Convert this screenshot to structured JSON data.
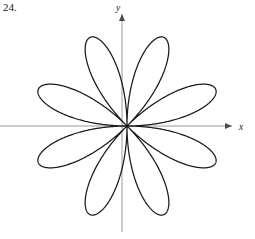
{
  "figure": {
    "problem_number": "24.",
    "width": 255,
    "height": 239,
    "background_color": "#ffffff"
  },
  "axes": {
    "x_label": "x",
    "y_label": "y",
    "axis_color": "#9a9a9a",
    "arrow_color": "#4a4a4a",
    "origin_x": 127,
    "origin_y": 126,
    "x_axis_y": 126,
    "y_axis_x": 122,
    "x_axis_start": 0,
    "x_axis_end": 232,
    "y_axis_start": 232,
    "y_axis_end": 14
  },
  "curve": {
    "color": "#1a1a1a",
    "stroke_width": 1.25,
    "petal_count": 8,
    "max_radius": 96,
    "angle_offset_deg": 22.5,
    "petal_angles_deg": [
      22.5,
      67.5,
      112.5,
      157.5,
      202.5,
      247.5,
      292.5,
      337.5
    ]
  },
  "chart_data": {
    "type": "line",
    "title": "",
    "subtitle": "",
    "xlabel": "x",
    "ylabel": "y",
    "grid": false,
    "legend": "none",
    "coordinate_system": "polar",
    "equation": "r = a cos(4θ)",
    "petal_count": 8,
    "amplitude": 96,
    "frequency_k": 4,
    "angle_offset_deg": 22.5,
    "xlim": [
      -127,
      128
    ],
    "ylim": [
      -113,
      126
    ],
    "annotations": [
      "24."
    ],
    "tick_labels": [],
    "petals": [
      {
        "index": 1,
        "tip_angle_deg": 22.5,
        "tip_radius": 96
      },
      {
        "index": 2,
        "tip_angle_deg": 67.5,
        "tip_radius": 96
      },
      {
        "index": 3,
        "tip_angle_deg": 112.5,
        "tip_radius": 96
      },
      {
        "index": 4,
        "tip_angle_deg": 157.5,
        "tip_radius": 96
      },
      {
        "index": 5,
        "tip_angle_deg": 202.5,
        "tip_radius": 96
      },
      {
        "index": 6,
        "tip_angle_deg": 247.5,
        "tip_radius": 96
      },
      {
        "index": 7,
        "tip_angle_deg": 292.5,
        "tip_radius": 96
      },
      {
        "index": 8,
        "tip_angle_deg": 337.5,
        "tip_radius": 96
      }
    ]
  }
}
